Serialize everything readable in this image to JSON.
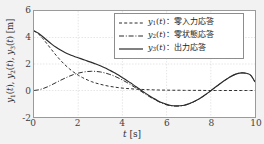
{
  "figure": {
    "background_color": "#f2f2f2",
    "plot_background_color": "#ffffff",
    "axis_color": "#9a9a9a",
    "grid_color": "#d2d2d2",
    "curve_color": "#2b2b2b"
  },
  "axes": {
    "xlabel_var": "t",
    "xlabel_unit": "[s]",
    "ylabel": "y1(t), y2(t), y3(t) [m]",
    "xticks": [
      "0",
      "2",
      "4",
      "6",
      "8",
      "10"
    ],
    "yticks": [
      "6",
      "4",
      "2",
      "0",
      "-2"
    ]
  },
  "legend": {
    "entries": [
      {
        "style": "dashed",
        "var": "y",
        "sub": "1",
        "arg": "(t)",
        "sep": "：",
        "label": "零入力応答"
      },
      {
        "style": "dashdot",
        "var": "y",
        "sub": "2",
        "arg": "(t)",
        "sep": "：",
        "label": "零状態応答"
      },
      {
        "style": "solid",
        "var": "y",
        "sub": "3",
        "arg": "(t)",
        "sep": "：",
        "label": "出力応答"
      }
    ]
  },
  "chart_data": {
    "type": "line",
    "title": "",
    "xlabel": "t [s]",
    "ylabel": "y1(t), y2(t), y3(t) [m]",
    "xlim": [
      0,
      10
    ],
    "ylim": [
      -2,
      6
    ],
    "xticks": [
      0,
      2,
      4,
      6,
      8,
      10
    ],
    "yticks": [
      -2,
      0,
      2,
      4,
      6
    ],
    "grid": true,
    "legend_position": "upper right",
    "x": [
      0.0,
      0.2,
      0.4,
      0.6,
      0.8,
      1.0,
      1.2,
      1.4,
      1.6,
      1.8,
      2.0,
      2.2,
      2.4,
      2.6,
      2.8,
      3.0,
      3.2,
      3.4,
      3.6,
      3.8,
      4.0,
      4.2,
      4.4,
      4.6,
      4.8,
      5.0,
      5.2,
      5.4,
      5.6,
      5.8,
      6.0,
      6.2,
      6.4,
      6.6,
      6.8,
      7.0,
      7.2,
      7.4,
      7.6,
      7.8,
      8.0,
      8.2,
      8.4,
      8.6,
      8.8,
      9.0,
      9.2,
      9.4,
      9.6,
      9.8,
      10.0
    ],
    "series": [
      {
        "name": "y1(t)：零入力応答",
        "style": "dashed",
        "description": "zero-input response, exponentially decaying from 4.5 to 0",
        "values": [
          4.5,
          4.27,
          3.92,
          3.5,
          3.07,
          2.66,
          2.28,
          1.94,
          1.64,
          1.38,
          1.16,
          0.97,
          0.81,
          0.67,
          0.56,
          0.47,
          0.39,
          0.32,
          0.27,
          0.22,
          0.18,
          0.15,
          0.13,
          0.1,
          0.09,
          0.07,
          0.06,
          0.05,
          0.04,
          0.03,
          0.03,
          0.02,
          0.02,
          0.02,
          0.01,
          0.01,
          0.01,
          0.01,
          0.01,
          0.0,
          0.0,
          0.0,
          0.0,
          0.0,
          0.0,
          0.0,
          0.0,
          0.0,
          0.0,
          0.0,
          0.0
        ]
      },
      {
        "name": "y2(t)：零状態応答",
        "style": "dashdot",
        "description": "zero-state response, oscillatory: rises to 1.45 at t=2.6, min -1.15 at t=5.8, peak 1.3 at t=9.0",
        "values": [
          0.0,
          0.05,
          0.14,
          0.27,
          0.43,
          0.6,
          0.77,
          0.93,
          1.08,
          1.21,
          1.31,
          1.38,
          1.43,
          1.45,
          1.44,
          1.4,
          1.33,
          1.23,
          1.11,
          0.96,
          0.79,
          0.61,
          0.41,
          0.2,
          -0.01,
          -0.23,
          -0.44,
          -0.63,
          -0.81,
          -0.96,
          -1.08,
          -1.15,
          -1.18,
          -1.17,
          -1.12,
          -1.02,
          -0.88,
          -0.71,
          -0.5,
          -0.27,
          -0.02,
          0.24,
          0.49,
          0.73,
          0.95,
          1.14,
          1.27,
          1.33,
          1.3,
          1.16,
          0.65
        ]
      },
      {
        "name": "y3(t)：出力応答",
        "style": "solid",
        "description": "total output response, y3 = y1 + y2; starts 4.5, peaks 4.6 at t=0.3, shoulder ~2.1 at t=3, min -1.15 at t=5.8, peak 1.3 at t=9.0",
        "values": [
          4.5,
          4.32,
          4.06,
          3.77,
          3.5,
          3.26,
          3.05,
          2.87,
          2.72,
          2.59,
          2.47,
          2.35,
          2.24,
          2.12,
          2.0,
          1.87,
          1.72,
          1.55,
          1.38,
          1.18,
          0.97,
          0.76,
          0.54,
          0.3,
          0.08,
          -0.16,
          -0.38,
          -0.58,
          -0.77,
          -0.93,
          -1.05,
          -1.13,
          -1.16,
          -1.15,
          -1.11,
          -1.01,
          -0.87,
          -0.7,
          -0.49,
          -0.27,
          -0.02,
          0.24,
          0.49,
          0.73,
          0.95,
          1.14,
          1.27,
          1.33,
          1.3,
          1.16,
          0.65
        ]
      }
    ]
  }
}
